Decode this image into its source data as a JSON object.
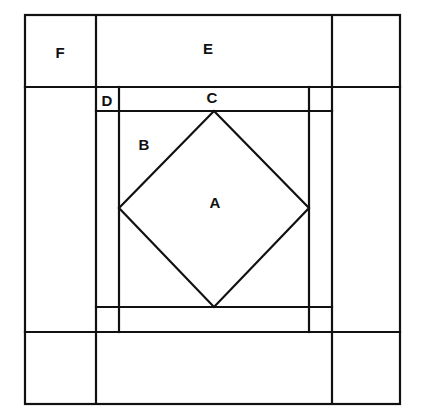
{
  "diagram": {
    "type": "quilt-block-pattern",
    "line_color": "#111111",
    "background": "#ffffff",
    "labels": {
      "A": "A",
      "B": "B",
      "C": "C",
      "D": "D",
      "E": "E",
      "F": "F"
    },
    "pieces": [
      {
        "id": "A",
        "shape": "square-on-point (center diamond)"
      },
      {
        "id": "B",
        "shape": "corner triangle around diamond"
      },
      {
        "id": "C",
        "shape": "inner border strip"
      },
      {
        "id": "D",
        "shape": "small corner square"
      },
      {
        "id": "E",
        "shape": "outer border strip"
      },
      {
        "id": "F",
        "shape": "large corner square"
      }
    ]
  }
}
